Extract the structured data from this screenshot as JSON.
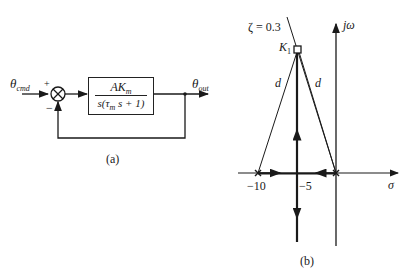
{
  "figure_a": {
    "input_label": "θ",
    "input_sub": "cmd",
    "plus_sign": "+",
    "minus_sign": "−",
    "tf_numerator_main": "AK",
    "tf_numerator_sub": "m",
    "tf_denominator": "s(τ",
    "tf_denominator_sub": "m",
    "tf_denominator_rest": " s + 1)",
    "output_label": "θ",
    "output_sub": "out",
    "caption": "(a)"
  },
  "figure_b": {
    "zeta_label": "ζ = 0.3",
    "gain_label": "K",
    "gain_sub": "1",
    "d_label_left": "d",
    "d_label_right": "d",
    "imag_axis_label": "jω",
    "real_axis_label": "σ",
    "tick_minus10": "−10",
    "tick_minus5": "−5",
    "caption": "(b)"
  }
}
